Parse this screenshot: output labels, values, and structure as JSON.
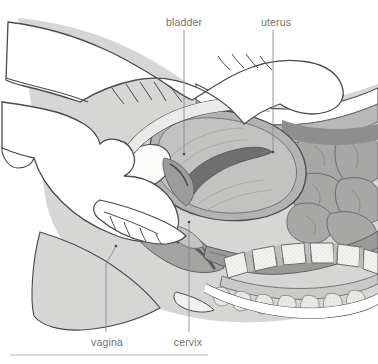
{
  "figure": {
    "kind": "anatomical-illustration",
    "background_color": "#ffffff",
    "line_color": "#4a4a4c",
    "label_color": "#6f6f72",
    "leader_color": "#8b8b8f"
  },
  "labels": [
    {
      "id": "bladder",
      "text": "bladder",
      "x": 184,
      "y": 16,
      "leader": {
        "from_x": 184,
        "from_y": 30,
        "to_x": 184,
        "to_y": 154
      }
    },
    {
      "id": "uterus",
      "text": "uterus",
      "x": 276,
      "y": 16,
      "leader": {
        "from_x": 273,
        "from_y": 30,
        "to_x": 273,
        "to_y": 152
      }
    },
    {
      "id": "vagina",
      "text": "vagina",
      "x": 107,
      "y": 336,
      "leader": {
        "from_x": 116,
        "from_y": 246,
        "to_x": 106,
        "to_y": 332
      }
    },
    {
      "id": "cervix",
      "text": "cervix",
      "x": 188,
      "y": 336,
      "leader": {
        "from_x": 189,
        "from_y": 222,
        "to_x": 189,
        "to_y": 332
      }
    }
  ],
  "palette": {
    "skin": "#ffffff",
    "body_light": "#d4d4d2",
    "body_mid": "#b9b9b7",
    "tissue_mid": "#a9a9a8",
    "tissue_dark": "#8e8e8e",
    "tissue_darker": "#777778",
    "muscle_deep": "#6d6d6e",
    "organ_light": "#c6c6c4",
    "bone_light": "#efefed",
    "bone_speckle": "#dcdcd9",
    "bladder_white": "#fbfbfa",
    "outline": "#4a4a4c",
    "outline_soft": "#6b6b6d"
  },
  "footer_rule": {
    "x1": 10,
    "x2": 208,
    "y": 355,
    "color": "#b6b6b6"
  }
}
